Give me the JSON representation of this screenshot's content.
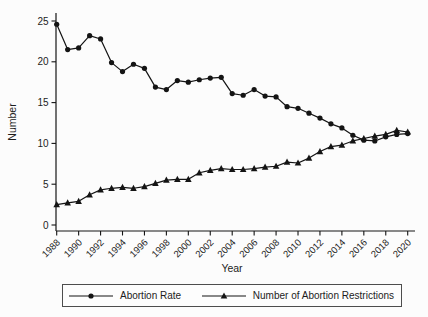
{
  "figure": {
    "background": "#fcfcfc",
    "line_color": "#141414",
    "text_color": "#1c1c1c"
  },
  "chart_data": {
    "type": "line",
    "title": "",
    "xlabel": "Year",
    "ylabel": "Number",
    "xlim": [
      1988,
      2020
    ],
    "ylim": [
      0,
      25
    ],
    "grid": false,
    "legend_position": "bottom",
    "x": [
      1988,
      1989,
      1990,
      1991,
      1992,
      1993,
      1994,
      1995,
      1996,
      1997,
      1998,
      1999,
      2000,
      2001,
      2002,
      2003,
      2004,
      2005,
      2006,
      2007,
      2008,
      2009,
      2010,
      2011,
      2012,
      2013,
      2014,
      2015,
      2016,
      2017,
      2018,
      2019,
      2020
    ],
    "xticks": [
      1988,
      1990,
      1992,
      1994,
      1996,
      1998,
      2000,
      2002,
      2004,
      2006,
      2008,
      2010,
      2012,
      2014,
      2016,
      2018,
      2020
    ],
    "yticks": [
      0,
      5,
      10,
      15,
      20,
      25
    ],
    "series": [
      {
        "name": "Abortion Rate",
        "marker": "circle",
        "color": "#141414",
        "values": [
          24.6,
          21.5,
          21.7,
          23.2,
          22.8,
          19.9,
          18.8,
          19.7,
          19.2,
          16.9,
          16.6,
          17.7,
          17.5,
          17.8,
          18.0,
          18.1,
          16.1,
          15.9,
          16.6,
          15.8,
          15.7,
          14.5,
          14.3,
          13.7,
          13.1,
          12.4,
          11.9,
          11.0,
          10.4,
          10.3,
          10.8,
          11.1,
          11.2
        ]
      },
      {
        "name": "Number of Abortion Restrictions",
        "marker": "triangle",
        "color": "#141414",
        "values": [
          2.5,
          2.7,
          2.9,
          3.7,
          4.3,
          4.5,
          4.6,
          4.5,
          4.7,
          5.1,
          5.5,
          5.6,
          5.6,
          6.4,
          6.7,
          6.9,
          6.8,
          6.8,
          6.9,
          7.1,
          7.2,
          7.7,
          7.6,
          8.2,
          9.0,
          9.6,
          9.8,
          10.3,
          10.6,
          10.9,
          11.1,
          11.6,
          11.4
        ]
      }
    ],
    "legend": [
      {
        "label": "Abortion Rate",
        "marker": "circle"
      },
      {
        "label": "Number of Abortion Restrictions",
        "marker": "triangle"
      }
    ]
  }
}
